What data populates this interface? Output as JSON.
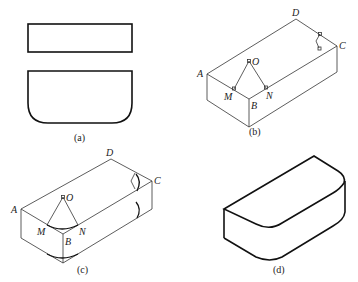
{
  "figures": {
    "a": {
      "caption": "(a)"
    },
    "b": {
      "caption": "(b)",
      "labels": {
        "A": "A",
        "B": "B",
        "C": "C",
        "D": "D",
        "O": "O",
        "M": "M",
        "N": "N"
      }
    },
    "c": {
      "caption": "(c)",
      "labels": {
        "A": "A",
        "B": "B",
        "C": "C",
        "D": "D",
        "O": "O",
        "M": "M",
        "N": "N"
      }
    },
    "d": {
      "caption": "(d)"
    }
  }
}
